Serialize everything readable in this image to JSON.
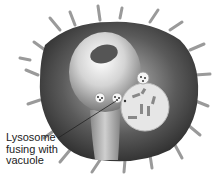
{
  "figure": {
    "label": "Lysosome\nfusing with\nvacuole",
    "caption_partial": "(B) L... ... ... ...th the vacuole"
  },
  "colors": {
    "cell_dark": "#2a2a2a",
    "cell_mid": "#6a6a6a",
    "highlight": "#f2f2f2",
    "vacuole": "#e6e6e6",
    "nucleus": "#555555",
    "spikes": "#9a9a9a"
  }
}
